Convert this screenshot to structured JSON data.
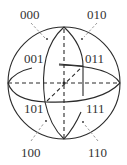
{
  "diagram": {
    "labels": {
      "l000": "000",
      "l010": "010",
      "l001": "001",
      "l011": "011",
      "l101": "101",
      "l111": "111",
      "l100": "100",
      "l110": "110"
    },
    "colors": {
      "stroke": "#2b2b2b",
      "pointer": "#9a9a9a",
      "text": "#333333",
      "background": "#ffffff"
    }
  }
}
